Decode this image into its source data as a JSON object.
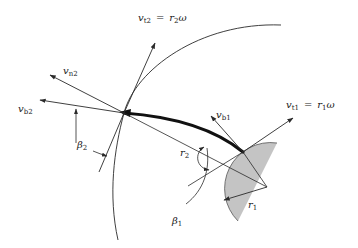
{
  "diagram": {
    "type": "centrifugal pump impeller velocity diagram",
    "colors": {
      "line": "#2a2a2a",
      "blade": "#111111",
      "hub_fill": "#c4c4c4",
      "background": "#ffffff"
    },
    "labels": {
      "vt2": {
        "sym": "v",
        "sub": "t2",
        "eq": "=",
        "rhs_sym": "r",
        "rhs_sub": "2",
        "rhs_w": "ω"
      },
      "vt1": {
        "sym": "v",
        "sub": "t1",
        "eq": "=",
        "rhs_sym": "r",
        "rhs_sub": "1",
        "rhs_w": "ω"
      },
      "vn2": {
        "sym": "v",
        "sub": "n2"
      },
      "vb2": {
        "sym": "v",
        "sub": "b2"
      },
      "vb1": {
        "sym": "v",
        "sub": "b1"
      },
      "beta2": {
        "sym": "β",
        "sub": "2"
      },
      "beta1": {
        "sym": "β",
        "sub": "1"
      },
      "r2": {
        "sym": "r",
        "sub": "2"
      },
      "r1": {
        "sym": "r",
        "sub": "1"
      }
    },
    "points": {
      "blade_outlet": [
        124,
        113
      ],
      "blade_inlet": [
        243,
        152
      ],
      "hub_center": [
        267,
        187
      ]
    }
  }
}
